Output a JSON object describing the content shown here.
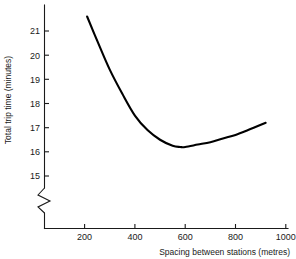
{
  "chart_data": {
    "type": "line",
    "title": "",
    "subtitle": "",
    "xlabel": "Spacing between stations (metres)",
    "ylabel": "Total trip time (minutes)",
    "xlim": [
      0,
      1000
    ],
    "ylim": [
      14.5,
      21.8
    ],
    "grid": false,
    "legend": null,
    "y_axis_break": true,
    "y_axis_break_symbol": "zigzag",
    "x_ticks": [
      200,
      400,
      600,
      800,
      1000
    ],
    "x_tick_labels": [
      "200",
      "400",
      "600",
      "800",
      "1000"
    ],
    "y_ticks": [
      15,
      16,
      17,
      18,
      19,
      20,
      21
    ],
    "y_tick_labels": [
      "15",
      "16",
      "17",
      "18",
      "19",
      "20",
      "21"
    ],
    "series": [
      {
        "name": "Total trip time",
        "color": "#000000",
        "x": [
          210,
          250,
          300,
          350,
          400,
          450,
          500,
          550,
          580,
          600,
          650,
          700,
          750,
          800,
          850,
          920
        ],
        "values": [
          21.6,
          20.6,
          19.4,
          18.4,
          17.5,
          16.9,
          16.5,
          16.25,
          16.2,
          16.2,
          16.3,
          16.4,
          16.55,
          16.7,
          16.9,
          17.2
        ]
      }
    ],
    "annotations": [
      {
        "name": "minimum",
        "x": 580,
        "y": 16.2,
        "text": ""
      }
    ]
  },
  "axes": {
    "x_tick_0": "200",
    "x_tick_1": "400",
    "x_tick_2": "600",
    "x_tick_3": "800",
    "x_tick_4": "1000",
    "y_tick_0": "15",
    "y_tick_1": "16",
    "y_tick_2": "17",
    "y_tick_3": "18",
    "y_tick_4": "19",
    "y_tick_5": "20",
    "y_tick_6": "21",
    "x_title": "Spacing between stations (metres)",
    "y_title": "Total trip time (minutes)"
  }
}
